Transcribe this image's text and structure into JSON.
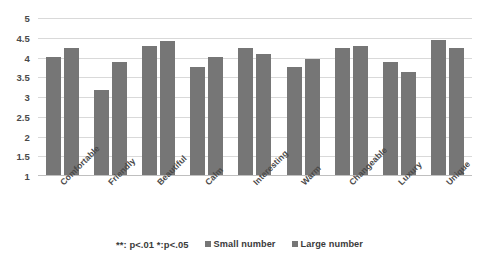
{
  "chart_data": {
    "type": "bar",
    "title": "",
    "xlabel": "",
    "ylabel": "",
    "ylim": [
      1,
      5
    ],
    "ytick_step": 0.5,
    "yticks": [
      "5",
      "4.5",
      "4",
      "3.5",
      "3",
      "2.5",
      "2",
      "1.5",
      "1"
    ],
    "grid": true,
    "legend_position": "bottom",
    "categories": [
      "Comfortable",
      "Friendly",
      "Beautiful",
      "Calm",
      "Interesting",
      "Warm",
      "Changeable",
      "Luxury",
      "Unique"
    ],
    "series": [
      {
        "name": "Small number",
        "color": "#767676",
        "values": [
          4.02,
          3.18,
          4.28,
          3.75,
          4.25,
          3.76,
          4.25,
          3.89,
          4.45
        ]
      },
      {
        "name": "Large number",
        "color": "#767676",
        "values": [
          4.23,
          3.89,
          4.42,
          4.02,
          4.1,
          3.97,
          4.28,
          3.64,
          4.23
        ]
      }
    ],
    "annotations": [
      "**: p<.01 *:p<.05"
    ]
  },
  "legend": {
    "significance_note": "**: p<.01  *:p<.05",
    "items": [
      {
        "label": "Small number",
        "color": "#767676"
      },
      {
        "label": "Large number",
        "color": "#767676"
      }
    ]
  },
  "colors": {
    "bar": "#767676",
    "gridline": "#d9d9d9",
    "axis": "#bfbfbf",
    "text": "#3b3b3b",
    "background": "#ffffff"
  }
}
